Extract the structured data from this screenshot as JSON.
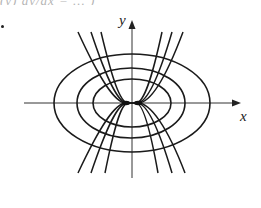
{
  "figure": {
    "top_fragment_text": "(y) dy/dx = ... )",
    "axis_labels": {
      "x": "x",
      "y": "y"
    },
    "stroke_color": "#1a1a1a",
    "axis_color": "#333333"
  },
  "diagram": {
    "type": "orthogonal-trajectories",
    "origin_px": [
      132,
      103
    ],
    "x_axis": {
      "from": 24,
      "to": 241
    },
    "y_axis": {
      "from": 178,
      "to": 21
    },
    "ellipses": [
      {
        "name": "inner",
        "rx": 39,
        "ry": 24
      },
      {
        "name": "middle",
        "rx": 54,
        "ry": 35
      },
      {
        "name": "outer",
        "rx": 78,
        "ry": 49
      }
    ],
    "curves_upper": [
      {
        "left_end_x": 78,
        "right_end_x": 183
      },
      {
        "left_end_x": 91,
        "right_end_x": 172
      },
      {
        "left_end_x": 101,
        "right_end_x": 162
      }
    ],
    "curves_lower": [
      {
        "left_end_x": 78,
        "right_end_x": 185
      },
      {
        "left_end_x": 91,
        "right_end_x": 172
      },
      {
        "left_end_x": 105,
        "right_end_x": 158
      }
    ]
  }
}
